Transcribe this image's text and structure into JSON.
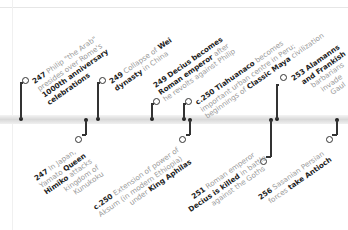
{
  "timeline": {
    "above": [
      {
        "year": "247",
        "lines": [
          [
            "Philip \"the Arab\""
          ],
          [
            "presides over Rome's"
          ],
          [
            "",
            "1000th anniversary"
          ],
          [
            "",
            "celebrations"
          ]
        ]
      },
      {
        "year": "249",
        "lines": [
          [
            "Collapse of ",
            "Wei"
          ],
          [
            "",
            "dynasty",
            " in China"
          ]
        ]
      },
      {
        "year": "249",
        "lines": [
          [
            "",
            "Decius becomes"
          ],
          [
            "",
            "Roman emperor",
            " after"
          ],
          [
            "he revolts against Philip"
          ]
        ]
      },
      {
        "year": "c.250",
        "lines": [
          [
            "",
            "Tiahuanaco",
            " becomes"
          ],
          [
            "important urban centre in Peru;"
          ],
          [
            "beginnings of ",
            "Classic Maya",
            " civilization"
          ]
        ]
      },
      {
        "year": "253",
        "lines": [
          [
            "",
            "Alamanns"
          ],
          [
            "",
            "and Frankish"
          ],
          [
            "barbarians"
          ],
          [
            "invade"
          ],
          [
            "Gaul"
          ]
        ]
      }
    ],
    "below": [
      {
        "year": "247",
        "lines": [
          [
            "In Japan,"
          ],
          [
            "Yamato ",
            "Queen"
          ],
          [
            "",
            "Himiko",
            " attacks"
          ],
          [
            "kingdom of"
          ],
          [
            "Kunukoku"
          ]
        ]
      },
      {
        "year": "c.250",
        "lines": [
          [
            "Extension of power of"
          ],
          [
            "Aksum (in modern Ethiopia)"
          ],
          [
            "under ",
            "King Aphilas"
          ]
        ]
      },
      {
        "year": "251",
        "lines": [
          [
            "Roman emperor"
          ],
          [
            "",
            "Decius is killed",
            " in battle"
          ],
          [
            "against the Goths"
          ]
        ]
      },
      {
        "year": "256",
        "lines": [
          [
            "Sasanian Persian"
          ],
          [
            "forces ",
            "take Antioch"
          ]
        ]
      }
    ]
  },
  "colors": {
    "marker": "#222222",
    "bar": "#d9d9d9",
    "text_light": "#9a9a9a",
    "text_bold": "#222222"
  }
}
